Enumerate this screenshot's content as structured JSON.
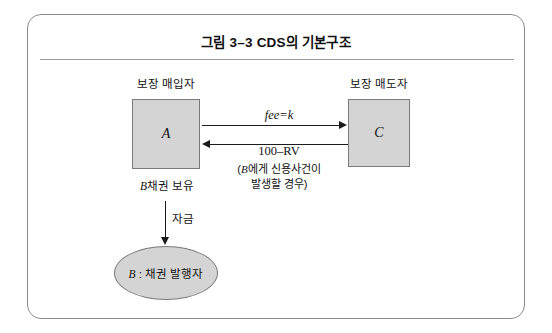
{
  "figure": {
    "title": "그림 3–3   CDS의 기본구조",
    "frame_color": "#8c8c8c",
    "shape_fill": "#d4d4d4",
    "shape_stroke": "#7a7a7a",
    "line_color": "#1a1a1a"
  },
  "nodes": {
    "protection_buyer": {
      "caption": "보장 매입자",
      "letter": "A",
      "shape": "rectangle"
    },
    "protection_seller": {
      "caption": "보장 매도자",
      "letter": "C",
      "shape": "rectangle"
    },
    "bond_issuer": {
      "letter": "B",
      "label_rest": " : 채권 발행자",
      "shape": "ellipse"
    }
  },
  "flows": {
    "fee": {
      "label": "fee=k",
      "direction": "A-to-C"
    },
    "settlement": {
      "label": "100–RV",
      "direction": "C-to-A",
      "note_line1_italic": "B",
      "note_line1_rest": "에게 신용사건이",
      "note_line2": "발생할 경우)",
      "note_open_paren": "("
    },
    "bond_holding": {
      "label_italic": "B",
      "label_rest": "채권 보유"
    },
    "funding": {
      "label": "자금",
      "direction": "A-to-B"
    }
  }
}
